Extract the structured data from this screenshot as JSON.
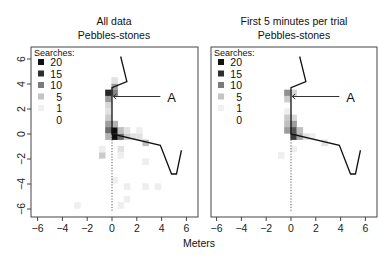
{
  "chart_data": [
    {
      "type": "heatmap",
      "title": "All data",
      "subtitle": "Pebbles-stones",
      "xlabel": "Meters",
      "ylabel": "",
      "xlim": [
        -6.5,
        6.9
      ],
      "ylim": [
        -6.6,
        7.0
      ],
      "x_ticks": [
        -6,
        -4,
        -2,
        0,
        2,
        4,
        6
      ],
      "y_ticks": [
        -6,
        -4,
        -2,
        0,
        2,
        4,
        6
      ],
      "grid": false,
      "legend": {
        "title": "Searches:",
        "position": "top-left",
        "entries": [
          {
            "label": "20",
            "color": "#111111"
          },
          {
            "label": "15",
            "color": "#2e2e2e"
          },
          {
            "label": "10",
            "color": "#7a7a7a"
          },
          {
            "label": "5",
            "color": "#c4c4c4"
          },
          {
            "label": "1",
            "color": "#f0f0f0"
          },
          {
            "label": "0",
            "color": "#ffffff"
          }
        ]
      },
      "annotation": {
        "text": "A",
        "x": 3.9,
        "y": 3.0,
        "arrow_to": [
          0.1,
          3.0
        ]
      },
      "path": [
        [
          0.7,
          6.2
        ],
        [
          1.2,
          4.2
        ],
        [
          0.0,
          3.7
        ],
        [
          0.0,
          0.0
        ],
        [
          3.9,
          -0.9
        ],
        [
          4.8,
          -3.2
        ],
        [
          5.2,
          -3.2
        ],
        [
          5.6,
          -1.3
        ]
      ],
      "reference_line": {
        "x": 0,
        "y_from": 0,
        "y_to": -6.2,
        "style": "dotted"
      },
      "cells": [
        {
          "x": -0.3,
          "y": 3.3,
          "v": 18
        },
        {
          "x": 0.2,
          "y": 3.3,
          "v": 10
        },
        {
          "x": 0.2,
          "y": 3.8,
          "v": 8
        },
        {
          "x": -0.3,
          "y": 2.8,
          "v": 8
        },
        {
          "x": -0.3,
          "y": 2.3,
          "v": 3
        },
        {
          "x": -0.3,
          "y": 1.8,
          "v": 2
        },
        {
          "x": -0.3,
          "y": 1.3,
          "v": 4
        },
        {
          "x": -0.3,
          "y": 0.8,
          "v": 8
        },
        {
          "x": 0.2,
          "y": 0.8,
          "v": 6
        },
        {
          "x": -0.3,
          "y": 0.3,
          "v": 12
        },
        {
          "x": 0.2,
          "y": 0.3,
          "v": 20
        },
        {
          "x": 0.2,
          "y": -0.2,
          "v": 20
        },
        {
          "x": 0.7,
          "y": -0.2,
          "v": 12
        },
        {
          "x": -0.3,
          "y": -0.2,
          "v": 6
        },
        {
          "x": 1.2,
          "y": -0.2,
          "v": 4
        },
        {
          "x": 1.7,
          "y": -0.2,
          "v": 2
        },
        {
          "x": 2.2,
          "y": -0.2,
          "v": 2
        },
        {
          "x": 2.7,
          "y": -0.7,
          "v": 5
        },
        {
          "x": 0.2,
          "y": 0.8,
          "v": 6
        },
        {
          "x": 0.7,
          "y": 0.3,
          "v": 5
        },
        {
          "x": 1.2,
          "y": 0.3,
          "v": 2
        },
        {
          "x": -0.8,
          "y": -1.7,
          "v": 4
        },
        {
          "x": -0.8,
          "y": -1.2,
          "v": 1
        },
        {
          "x": 0.7,
          "y": -1.2,
          "v": 2
        },
        {
          "x": 0.7,
          "y": -1.7,
          "v": 1
        },
        {
          "x": 1.2,
          "y": -4.2,
          "v": 1
        },
        {
          "x": 2.7,
          "y": -4.2,
          "v": 1
        },
        {
          "x": 3.7,
          "y": -4.2,
          "v": 1
        },
        {
          "x": 0.2,
          "y": -3.7,
          "v": 1
        },
        {
          "x": -2.8,
          "y": -5.7,
          "v": 1
        },
        {
          "x": 0.7,
          "y": -5.7,
          "v": 1
        },
        {
          "x": 1.2,
          "y": -5.2,
          "v": 1
        },
        {
          "x": 2.7,
          "y": -2.2,
          "v": 1
        },
        {
          "x": 0.2,
          "y": 4.3,
          "v": 2
        },
        {
          "x": 2.2,
          "y": 0.3,
          "v": 1
        }
      ]
    },
    {
      "type": "heatmap",
      "title": "First 5 minutes per trial",
      "subtitle": "Pebbles-stones",
      "xlabel": "Meters",
      "ylabel": "",
      "xlim": [
        -6.5,
        6.9
      ],
      "ylim": [
        -6.6,
        7.0
      ],
      "x_ticks": [
        -6,
        -4,
        -2,
        0,
        2,
        4,
        6
      ],
      "y_ticks": [],
      "grid": false,
      "legend": {
        "title": "Searches:",
        "position": "top-left",
        "entries": [
          {
            "label": "20",
            "color": "#111111"
          },
          {
            "label": "15",
            "color": "#2e2e2e"
          },
          {
            "label": "10",
            "color": "#7a7a7a"
          },
          {
            "label": "5",
            "color": "#c4c4c4"
          },
          {
            "label": "1",
            "color": "#f0f0f0"
          },
          {
            "label": "0",
            "color": "#ffffff"
          }
        ]
      },
      "annotation": {
        "text": "A",
        "x": 3.9,
        "y": 3.0,
        "arrow_to": [
          0.1,
          3.0
        ]
      },
      "path": [
        [
          0.7,
          6.2
        ],
        [
          1.2,
          4.2
        ],
        [
          0.0,
          3.7
        ],
        [
          0.0,
          0.0
        ],
        [
          3.9,
          -0.9
        ],
        [
          4.8,
          -3.2
        ],
        [
          5.2,
          -3.2
        ],
        [
          5.6,
          -1.3
        ]
      ],
      "reference_line": {
        "x": 0,
        "y_from": 0,
        "y_to": -6.2,
        "style": "dotted"
      },
      "cells": [
        {
          "x": -0.3,
          "y": 3.3,
          "v": 9
        },
        {
          "x": -0.3,
          "y": 2.8,
          "v": 4
        },
        {
          "x": 0.2,
          "y": 3.3,
          "v": 3
        },
        {
          "x": -0.3,
          "y": 1.8,
          "v": 1
        },
        {
          "x": -0.3,
          "y": 1.3,
          "v": 4
        },
        {
          "x": 0.2,
          "y": 1.3,
          "v": 3
        },
        {
          "x": -0.3,
          "y": 0.8,
          "v": 5
        },
        {
          "x": 0.2,
          "y": 0.8,
          "v": 8
        },
        {
          "x": -0.3,
          "y": 0.3,
          "v": 8
        },
        {
          "x": 0.2,
          "y": 0.3,
          "v": 14
        },
        {
          "x": 0.7,
          "y": 0.3,
          "v": 5
        },
        {
          "x": 0.2,
          "y": -0.2,
          "v": 16
        },
        {
          "x": 0.7,
          "y": -0.2,
          "v": 7
        },
        {
          "x": 1.2,
          "y": -0.2,
          "v": 2
        },
        {
          "x": 1.7,
          "y": -0.2,
          "v": 1
        },
        {
          "x": 2.7,
          "y": -0.7,
          "v": 2
        },
        {
          "x": -0.8,
          "y": -1.7,
          "v": 1
        },
        {
          "x": 0.2,
          "y": -1.2,
          "v": 1
        }
      ]
    }
  ],
  "labels": {
    "left_title": "All data",
    "left_subtitle": "Pebbles-stones",
    "right_title": "First 5 minutes per trial",
    "right_subtitle": "Pebbles-stones",
    "xlabel": "Meters"
  }
}
